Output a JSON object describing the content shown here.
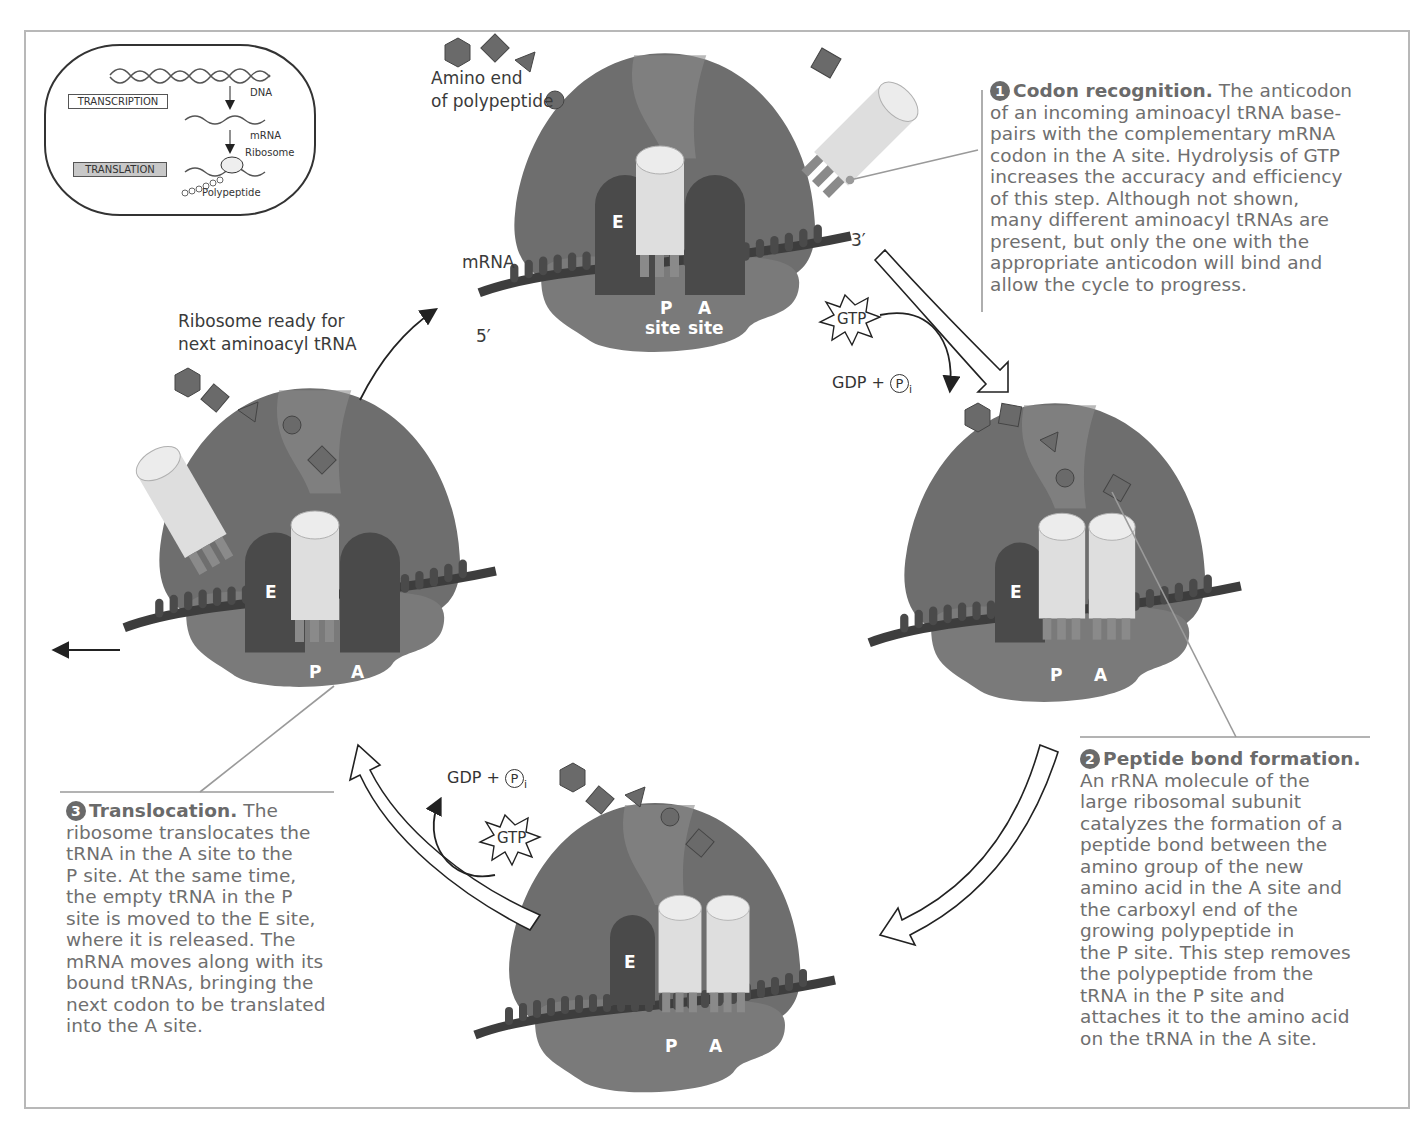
{
  "figure": {
    "inset": {
      "boxes": [
        {
          "label": "TRANSCRIPTION",
          "shaded": false
        },
        {
          "label": "TRANSLATION",
          "shaded": true
        }
      ],
      "labels": {
        "dna": "DNA",
        "mrna": "mRNA",
        "ribosome": "Ribosome",
        "polypeptide": "Polypeptide"
      }
    },
    "top_ribosome": {
      "amino_end_label_1": "Amino end",
      "amino_end_label_2": "of polypeptide",
      "mrna_label": "mRNA",
      "five_prime": "5′",
      "three_prime": "3′",
      "sites": {
        "e": "E",
        "p": "P",
        "a": "A",
        "p_site": "site",
        "a_site": "site"
      }
    },
    "left_ribosome": {
      "ready_label_1": "Ribosome ready for",
      "ready_label_2": "next aminoacyl tRNA",
      "sites": {
        "e": "E",
        "p": "P",
        "a": "A"
      }
    },
    "right_ribosome": {
      "sites": {
        "e": "E",
        "p": "P",
        "a": "A"
      }
    },
    "bottom_ribosome": {
      "sites": {
        "e": "E",
        "p": "P",
        "a": "A"
      }
    },
    "energy": {
      "gtp": "GTP",
      "gdp": "GDP +",
      "p": "P",
      "i": "i"
    },
    "steps": [
      {
        "number": "1",
        "title": "Codon recognition.",
        "body": "The anticodon of an incoming aminoacyl tRNA base-pairs with the complementary mRNA codon in the A site. Hydrolysis of GTP increases the accuracy and efficiency of this step. Although not shown, many different aminoacyl tRNAs are present, but only the one with the appropriate anticodon will bind and allow the cycle to progress.",
        "lines": [
          "The anticodon",
          "of an incoming aminoacyl tRNA base-",
          "pairs with the complementary mRNA",
          "codon in the A site. Hydrolysis of GTP",
          "increases the accuracy and efficiency",
          "of this step. Although not shown,",
          "many different aminoacyl tRNAs are",
          "present, but only the one with the",
          "appropriate anticodon will bind and",
          "allow the cycle to progress."
        ]
      },
      {
        "number": "2",
        "title": "Peptide bond formation.",
        "lines": [
          "An rRNA molecule of the",
          "large ribosomal subunit",
          "catalyzes the formation of a",
          "peptide bond between the",
          "amino group of the new",
          "amino acid in the A site and",
          "the carboxyl end of the",
          "growing polypeptide in",
          "the P site. This step removes",
          "the polypeptide from the",
          "tRNA in the P site and",
          "attaches it to the amino acid",
          "on the tRNA in the A site."
        ]
      },
      {
        "number": "3",
        "title": "Translocation.",
        "lines": [
          "The",
          "ribosome translocates the",
          "tRNA in the A site to the",
          "P site. At the same time,",
          "the empty tRNA in the P",
          "site is moved to the E site,",
          "where it is released. The",
          "mRNA moves along with its",
          "bound tRNAs, bringing the",
          "next codon to be translated",
          "into the A site."
        ]
      }
    ],
    "colors": {
      "ribosome_large": "#6e6e6e",
      "ribosome_small": "#7a7a7a",
      "site_dark": "#4a4a4a",
      "trna": "#e2e2e2",
      "text": "#707070",
      "frame": "#b8b8b8"
    }
  }
}
